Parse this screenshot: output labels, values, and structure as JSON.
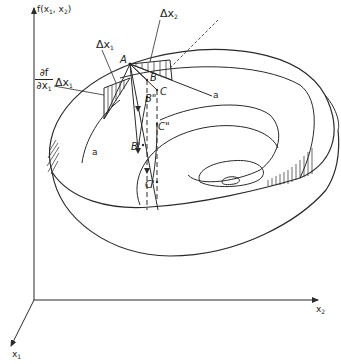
{
  "figure": {
    "type": "3d-surface-diagram"
  },
  "axes": {
    "vertical": {
      "label": "f(x",
      "sub1": "1",
      "mid": ", x",
      "sub2": "2",
      "close": ")"
    },
    "x2": {
      "label": "x",
      "sub": "2"
    },
    "x1": {
      "label": "x",
      "sub": "1"
    }
  },
  "labels": {
    "delta_x1": {
      "text": "Δx",
      "sub": "1"
    },
    "delta_x2": {
      "text": "Δx",
      "sub": "2"
    },
    "partial_num": "∂f",
    "partial_den_text": "∂x",
    "partial_den_sub": "1",
    "partial_times": "Δx",
    "partial_times_sub": "1",
    "point_A": "A",
    "point_B": "B",
    "point_B2": "B\"",
    "point_B1": "B'",
    "point_C": "C",
    "point_C2": "C\"",
    "point_C1": "C'",
    "line_a_right": "a",
    "line_a_left": "a"
  },
  "colors": {
    "ink": "#2a2a2a",
    "background": "#ffffff"
  }
}
